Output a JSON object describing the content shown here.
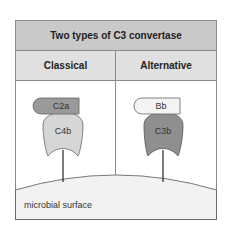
{
  "title": "Two types of C3 convertase",
  "columns": [
    {
      "heading": "Classical",
      "top_component": "C2a",
      "bottom_component": "C4b",
      "top_color": "#9a9a9a",
      "bottom_color": "#d6d6d6"
    },
    {
      "heading": "Alternative",
      "top_component": "Bb",
      "bottom_component": "C3b",
      "top_color": "#f4f4f4",
      "bottom_color": "#8f8f8f"
    }
  ],
  "surface_label": "microbial surface"
}
